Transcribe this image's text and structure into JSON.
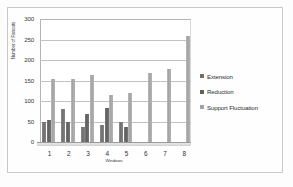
{
  "chart_data": {
    "type": "bar",
    "title": "",
    "xlabel": "Windows",
    "ylabel": "Number of Fanouts",
    "categories": [
      "1",
      "2",
      "3",
      "4",
      "5",
      "6",
      "7",
      "8"
    ],
    "yticks": [
      "300",
      "250",
      "200",
      "150",
      "100",
      "50",
      "0"
    ],
    "ylim": [
      0,
      300
    ],
    "ytick_step": 50,
    "grid": true,
    "legend_position": "right",
    "series": [
      {
        "name": "Extension",
        "color": "#6f6f6f",
        "values": [
          48,
          80,
          36,
          41,
          48,
          0,
          0,
          0
        ]
      },
      {
        "name": "Reduction",
        "color": "#5f5f5f",
        "values": [
          53,
          50,
          69,
          83,
          37,
          0,
          0,
          0
        ]
      },
      {
        "name": "Support Fluctuation",
        "color": "#a3a3a3",
        "values": [
          153,
          153,
          163,
          115,
          119,
          168,
          177,
          258
        ]
      }
    ]
  }
}
